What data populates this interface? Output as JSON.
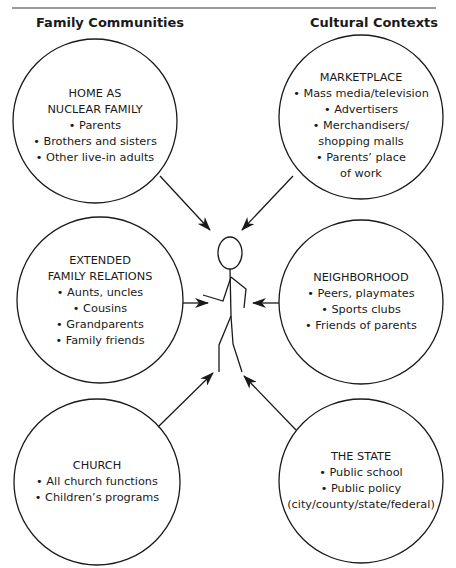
{
  "headers": {
    "left": "Family Communities",
    "right": "Cultural Contexts"
  },
  "center": {
    "label": "child stick figure",
    "icon": "stick-figure-icon"
  },
  "nodes": {
    "home": {
      "title_lines": [
        "HOME AS",
        "NUCLEAR FAMILY"
      ],
      "items": [
        "• Parents",
        "• Brothers and sisters",
        "• Other live-in adults"
      ]
    },
    "marketplace": {
      "title_lines": [
        "MARKETPLACE"
      ],
      "items": [
        "• Mass media/television",
        "• Advertisers",
        "• Merchandisers/",
        "shopping malls",
        "• Parents’ place",
        "of work"
      ]
    },
    "extended": {
      "title_lines": [
        "EXTENDED",
        "FAMILY RELATIONS"
      ],
      "items": [
        "• Aunts, uncles",
        "• Cousins",
        "• Grandparents",
        "• Family friends"
      ]
    },
    "neighborhood": {
      "title_lines": [
        "NEIGHBORHOOD"
      ],
      "items": [
        "• Peers, playmates",
        "• Sports clubs",
        "• Friends of parents"
      ]
    },
    "church": {
      "title_lines": [
        "CHURCH"
      ],
      "items": [
        "• All church functions",
        "• Children’s programs"
      ]
    },
    "state": {
      "title_lines": [
        "THE STATE"
      ],
      "items": [
        "• Public school",
        "• Public policy",
        "(city/county/state/federal)"
      ]
    }
  },
  "colors": {
    "stroke": "#1a1a1a",
    "rule": "#9a9a9a",
    "background": "#ffffff"
  }
}
